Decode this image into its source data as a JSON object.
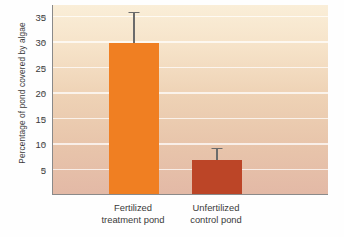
{
  "chart_data": {
    "type": "bar",
    "title": "",
    "subtitle": "",
    "xlabel": "",
    "ylabel": "Percentage of pond covered by algae",
    "categories": [
      "Fertilized treatment pond",
      "Unfertilized control pond"
    ],
    "category_lines": [
      [
        "Fertilized",
        "treatment pond"
      ],
      [
        "Unfertilized",
        "control pond"
      ]
    ],
    "values": [
      29.8,
      6.9
    ],
    "errors_upper": [
      6.2,
      2.4
    ],
    "error_tops": [
      36.0,
      9.3
    ],
    "bar_colors": [
      "#F07F22",
      "#BC4527"
    ],
    "ylim": [
      0,
      37.3
    ],
    "yticks": [
      5,
      10,
      15,
      20,
      25,
      30,
      35
    ],
    "ytick_labels": [
      "5",
      "10",
      "15",
      "20",
      "25",
      "30",
      "35"
    ],
    "grid": true,
    "grid_orientation": "horizontal",
    "legend": "none",
    "plot_background_top_color": "#faeed8",
    "plot_background_bottom_color": "#e3b9a6",
    "axis_color": "#8a8a8a",
    "errorbar_color": "#6b6b6b",
    "text_color": "#3a3a3a"
  }
}
